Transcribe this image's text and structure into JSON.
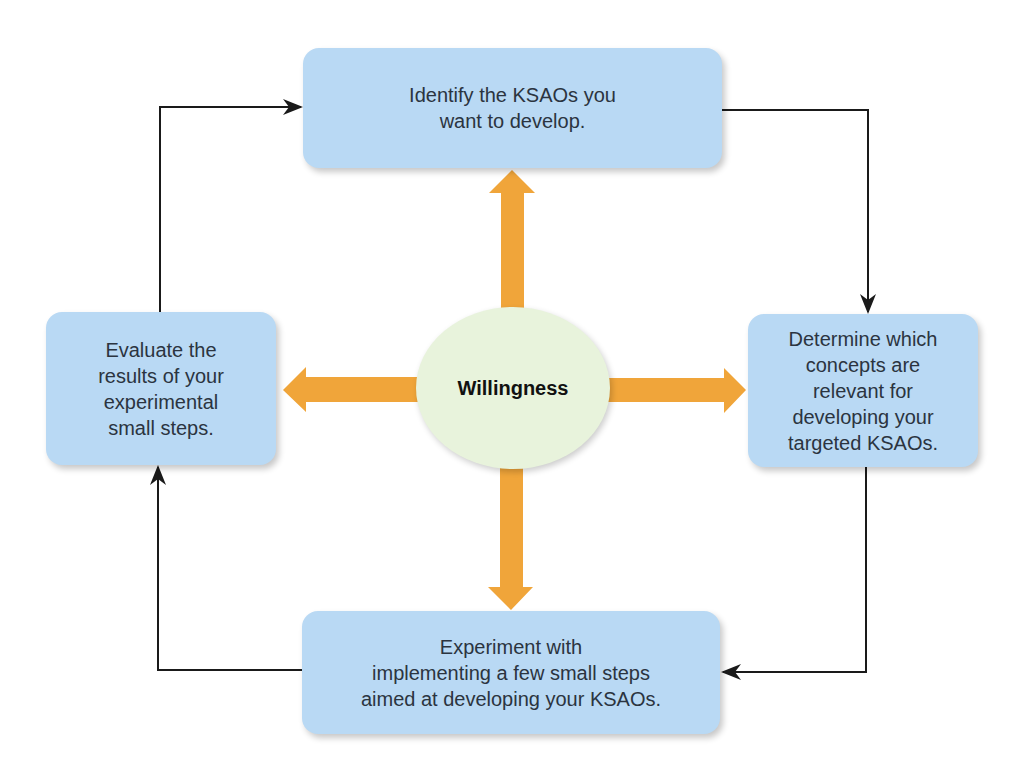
{
  "diagram": {
    "center": {
      "label": "Willingness",
      "color": "#e8f3dc"
    },
    "nodes": [
      {
        "id": "top",
        "label": "Identify the KSAOs you\nwant to develop."
      },
      {
        "id": "right",
        "label": "Determine which\nconcepts are\nrelevant for\ndeveloping your\ntargeted KSAOs."
      },
      {
        "id": "bottom",
        "label": "Experiment with\nimplementing a few small steps\naimed at developing your KSAOs."
      },
      {
        "id": "left",
        "label": "Evaluate the\nresults of your\nexperimental\nsmall steps."
      }
    ],
    "colors": {
      "box": "#b9d9f4",
      "arrow": "#f0a53a",
      "connector": "#1a1a1a"
    },
    "flow": [
      "top",
      "right",
      "bottom",
      "left",
      "top"
    ]
  }
}
